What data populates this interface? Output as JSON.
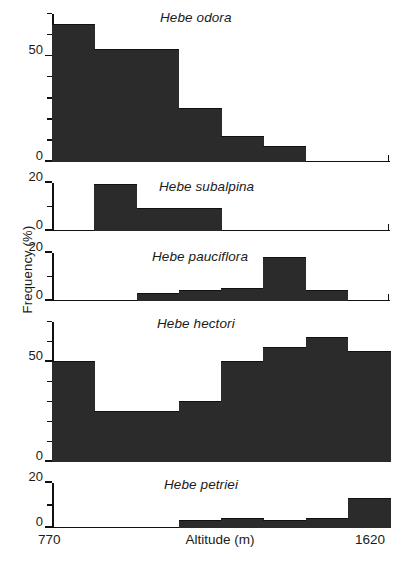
{
  "figure": {
    "y_axis_label": "Frequency (%)",
    "x_axis_label": "Altitude (m)",
    "x_min_label": "770",
    "x_max_label": "1620",
    "bar_color": "#2b2b2b"
  },
  "panels": [
    {
      "title": "Hebe odora",
      "y_ticks": [
        "50",
        "0"
      ],
      "y_tick_zero": "0",
      "y_tick_fifty": "50"
    },
    {
      "title": "Hebe subalpina",
      "y_tick_top": "20",
      "y_tick_zero": "0"
    },
    {
      "title": "Hebe pauciflora",
      "y_tick_top": "20",
      "y_tick_zero": "0"
    },
    {
      "title": "Hebe hectori",
      "y_tick_fifty": "50",
      "y_tick_zero": "0"
    },
    {
      "title": "Hebe petriei",
      "y_tick_top": "20",
      "y_tick_zero": "0"
    }
  ],
  "chart_data": [
    {
      "type": "bar",
      "title": "Hebe odora",
      "xlabel": "Altitude (m)",
      "ylabel": "Frequency (%)",
      "xlim": [
        770,
        1620
      ],
      "ylim": [
        0,
        70
      ],
      "yticks": [
        0,
        10,
        20,
        30,
        40,
        50,
        60,
        70
      ],
      "ytick_labels": {
        "0": "0",
        "50": "50"
      },
      "grid": false,
      "bin_edges": [
        770,
        876,
        982,
        1088,
        1194,
        1301,
        1407,
        1513,
        1620
      ],
      "categories": [
        "770-876",
        "876-982",
        "982-1088",
        "1088-1194",
        "1194-1301",
        "1301-1407",
        "1407-1513",
        "1513-1620"
      ],
      "values": [
        65,
        53,
        53,
        25,
        12,
        7,
        0,
        0
      ]
    },
    {
      "type": "bar",
      "title": "Hebe subalpina",
      "xlabel": "Altitude (m)",
      "ylabel": "Frequency (%)",
      "xlim": [
        770,
        1620
      ],
      "ylim": [
        0,
        20
      ],
      "yticks": [
        0,
        10,
        20
      ],
      "ytick_labels": {
        "0": "0",
        "20": "20"
      },
      "grid": false,
      "bin_edges": [
        770,
        876,
        982,
        1088,
        1194,
        1301,
        1407,
        1513,
        1620
      ],
      "categories": [
        "770-876",
        "876-982",
        "982-1088",
        "1088-1194",
        "1194-1301",
        "1301-1407",
        "1407-1513",
        "1513-1620"
      ],
      "values": [
        0,
        19,
        9,
        9,
        0,
        0,
        0,
        0
      ]
    },
    {
      "type": "bar",
      "title": "Hebe pauciflora",
      "xlabel": "Altitude (m)",
      "ylabel": "Frequency (%)",
      "xlim": [
        770,
        1620
      ],
      "ylim": [
        0,
        20
      ],
      "yticks": [
        0,
        10,
        20
      ],
      "ytick_labels": {
        "0": "0",
        "20": "20"
      },
      "grid": false,
      "bin_edges": [
        770,
        876,
        982,
        1088,
        1194,
        1301,
        1407,
        1513,
        1620
      ],
      "categories": [
        "770-876",
        "876-982",
        "982-1088",
        "1088-1194",
        "1194-1301",
        "1301-1407",
        "1407-1513",
        "1513-1620"
      ],
      "values": [
        0,
        0,
        3,
        4,
        5,
        18,
        4,
        0
      ]
    },
    {
      "type": "bar",
      "title": "Hebe hectori",
      "xlabel": "Altitude (m)",
      "ylabel": "Frequency (%)",
      "xlim": [
        770,
        1620
      ],
      "ylim": [
        0,
        70
      ],
      "yticks": [
        0,
        10,
        20,
        30,
        40,
        50,
        60,
        70
      ],
      "ytick_labels": {
        "0": "0",
        "50": "50"
      },
      "grid": false,
      "bin_edges": [
        770,
        876,
        982,
        1088,
        1194,
        1301,
        1407,
        1513,
        1620
      ],
      "categories": [
        "770-876",
        "876-982",
        "982-1088",
        "1088-1194",
        "1194-1301",
        "1301-1407",
        "1407-1513",
        "1513-1620"
      ],
      "values": [
        50,
        25,
        25,
        30,
        50,
        57,
        62,
        55
      ]
    },
    {
      "type": "bar",
      "title": "Hebe petriei",
      "xlabel": "Altitude (m)",
      "ylabel": "Frequency (%)",
      "xlim": [
        770,
        1620
      ],
      "ylim": [
        0,
        20
      ],
      "yticks": [
        0,
        10,
        20
      ],
      "ytick_labels": {
        "0": "0",
        "20": "20"
      },
      "grid": false,
      "bin_edges": [
        770,
        876,
        982,
        1088,
        1194,
        1301,
        1407,
        1513,
        1620
      ],
      "categories": [
        "770-876",
        "876-982",
        "982-1088",
        "1088-1194",
        "1194-1301",
        "1301-1407",
        "1407-1513",
        "1513-1620"
      ],
      "values": [
        0,
        0,
        0,
        3,
        4,
        3,
        4,
        13
      ]
    }
  ]
}
